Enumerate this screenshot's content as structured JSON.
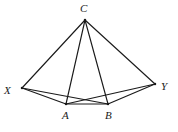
{
  "figure": {
    "background_color": "#ffffff",
    "line_color": "#1a1a1a",
    "width": 178,
    "height": 132,
    "vertices": [
      {
        "id": "C",
        "label": "C",
        "x": 85,
        "y": 20,
        "label_x": 80,
        "label_y": 3
      },
      {
        "id": "X",
        "label": "X",
        "x": 22,
        "y": 88,
        "label_x": 4,
        "label_y": 85
      },
      {
        "id": "Y",
        "label": "Y",
        "x": 155,
        "y": 84,
        "label_x": 161,
        "label_y": 81
      },
      {
        "id": "A",
        "label": "A",
        "x": 66,
        "y": 104,
        "label_x": 62,
        "label_y": 110
      },
      {
        "id": "B",
        "label": "B",
        "x": 108,
        "y": 104,
        "label_x": 105,
        "label_y": 110
      }
    ],
    "edges": [
      {
        "id": "C-X",
        "from": "C",
        "to": "X"
      },
      {
        "id": "C-A",
        "from": "C",
        "to": "A"
      },
      {
        "id": "C-B",
        "from": "C",
        "to": "B"
      },
      {
        "id": "C-Y",
        "from": "C",
        "to": "Y"
      },
      {
        "id": "X-A",
        "from": "X",
        "to": "A"
      },
      {
        "id": "X-B",
        "from": "X",
        "to": "B"
      },
      {
        "id": "Y-A",
        "from": "Y",
        "to": "A"
      },
      {
        "id": "Y-B",
        "from": "Y",
        "to": "B"
      },
      {
        "id": "A-B",
        "from": "A",
        "to": "B"
      }
    ]
  }
}
